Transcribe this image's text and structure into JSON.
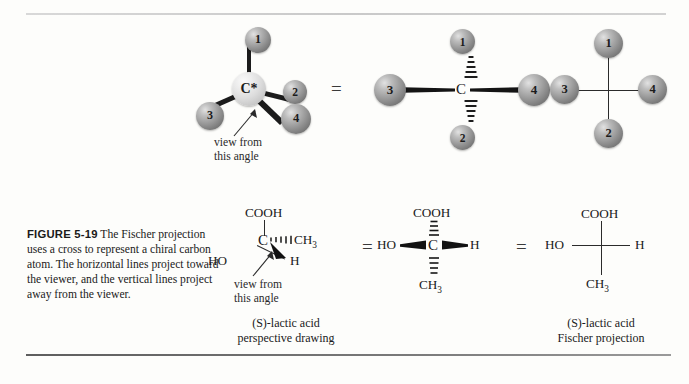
{
  "figure": {
    "label": "FIGURE 5-19",
    "caption": "The Fischer projection uses a cross to represent a chiral carbon atom. The horizontal lines project toward the viewer, and the vertical lines project away from the viewer."
  },
  "equals": {
    "sign": "="
  },
  "top_row": {
    "structure_3d": {
      "center_atom": "C*",
      "substituents": [
        "1",
        "2",
        "3",
        "4"
      ],
      "view_note_line1": "view from",
      "view_note_line2": "this angle"
    },
    "structure_wedge": {
      "center_atom": "C",
      "top": "1",
      "bottom": "2",
      "left": "3",
      "right": "4"
    },
    "structure_cross": {
      "top": "1",
      "bottom": "2",
      "left": "3",
      "right": "4"
    }
  },
  "bottom_row": {
    "perspective": {
      "center_atom": "C",
      "up": "COOH",
      "left": "HO",
      "hashed": "CH",
      "hashed_sub": "3",
      "wedge": "H",
      "view_note_line1": "view from",
      "view_note_line2": "this angle",
      "name_line1": "(S)-lactic acid",
      "name_line2": "perspective drawing"
    },
    "wedge_dash": {
      "center_atom": "C",
      "top": "COOH",
      "bottom": "CH",
      "bottom_sub": "3",
      "left": "HO",
      "right": "H"
    },
    "fischer": {
      "top": "COOH",
      "bottom": "CH",
      "bottom_sub": "3",
      "left": "HO",
      "right": "H",
      "name_line1": "(S)-lactic acid",
      "name_line2": "Fischer projection"
    }
  }
}
